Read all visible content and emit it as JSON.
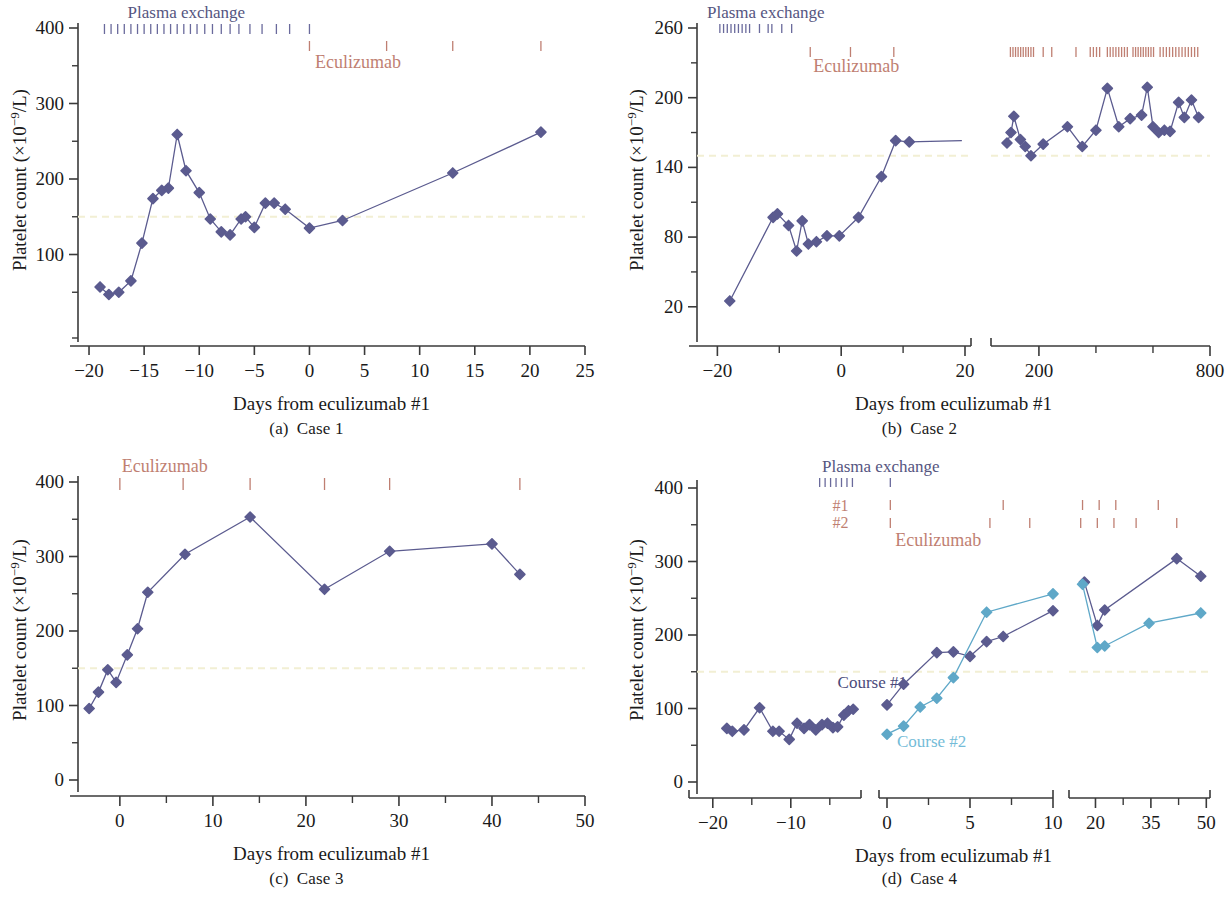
{
  "figure": {
    "axis_label_x": "Days from eculizumab #1",
    "axis_label_y": "Platelet count (×10−9/L)",
    "legend_plasma": "Plasma exchange",
    "legend_eculizumab": "Eculizumab",
    "colors": {
      "series_primary": "#5b5b8f",
      "series_secondary": "#5fa8c8",
      "plasma_tick": "#6a6a9c",
      "eculizumab_tick": "#bf7f72",
      "reference_line": "#f2efd4",
      "axis": "#3a3a3a",
      "text": "#1a1a1a"
    }
  },
  "panels": [
    {
      "id": "a",
      "caption_label": "(a)",
      "caption_title": "Case 1",
      "legend_plasma": "Plasma exchange",
      "legend_eculizumab": "Eculizumab",
      "reference_value": 150,
      "yticks": [
        100,
        200,
        300,
        400
      ],
      "ylim": [
        0,
        400
      ],
      "xticks": [
        -20,
        -15,
        -10,
        -5,
        0,
        5,
        10,
        15,
        20,
        25
      ],
      "xlim": [
        -21,
        25
      ],
      "plasma_ticks": [
        -18.6,
        -18.0,
        -17.4,
        -16.8,
        -16.2,
        -15.6,
        -15.0,
        -14.4,
        -13.8,
        -13.2,
        -12.6,
        -12.0,
        -11.4,
        -10.8,
        -10.2,
        -9.5,
        -8.8,
        -8.0,
        -7.2,
        -6.4,
        -5.4,
        -4.3,
        -3.0,
        -1.8,
        0.0
      ],
      "eculizumab_ticks": [
        0.0,
        7.0,
        13.0,
        21.0
      ]
    },
    {
      "id": "b",
      "caption_label": "(b)",
      "caption_title": "Case 2",
      "legend_plasma": "Plasma exchange",
      "legend_eculizumab": "Eculizumab",
      "reference_value": 150,
      "yticks": [
        20,
        80,
        140,
        200,
        260
      ],
      "ylim": [
        0,
        260
      ],
      "xticks_left": [
        -20,
        0,
        20
      ],
      "xlim_left": [
        -22,
        20
      ],
      "xticks_right": [
        200,
        800
      ],
      "xlim_right": [
        60,
        800
      ]
    },
    {
      "id": "c",
      "caption_label": "(c)",
      "caption_title": "Case 3",
      "legend_eculizumab": "Eculizumab",
      "reference_value": 150,
      "yticks": [
        0,
        100,
        200,
        300,
        400
      ],
      "ylim": [
        0,
        400
      ],
      "xticks": [
        0,
        10,
        20,
        30,
        40,
        50
      ],
      "xlim": [
        -4.5,
        50
      ],
      "eculizumab_ticks": [
        0.0,
        6.8,
        14.0,
        22.0,
        29.0,
        43.0
      ]
    },
    {
      "id": "d",
      "caption_label": "(d)",
      "caption_title": "Case 4",
      "legend_plasma": "Plasma exchange",
      "legend_eculizumab": "Eculizumab",
      "legend_course1": "Course #1",
      "legend_course2": "Course #2",
      "row_label_1": "#1",
      "row_label_2": "#2",
      "reference_value": 150,
      "yticks": [
        0,
        100,
        200,
        300,
        400
      ],
      "ylim": [
        0,
        400
      ],
      "xticks_left": [
        -20,
        -10
      ],
      "xticks_mid": [
        0,
        5,
        10
      ],
      "xticks_right": [
        20,
        35,
        50
      ]
    }
  ],
  "chart_data": [
    {
      "type": "line",
      "panel": "a",
      "title": "(a) Case 1",
      "xlabel": "Days from eculizumab #1",
      "ylabel": "Platelet count (×10−9/L)",
      "xlim": [
        -21,
        25
      ],
      "ylim": [
        0,
        400
      ],
      "xticks": [
        -20,
        -15,
        -10,
        -5,
        0,
        5,
        10,
        15,
        20,
        25
      ],
      "yticks": [
        100,
        200,
        300,
        400
      ],
      "grid": false,
      "reference_line": {
        "y": 150,
        "style": "dashed",
        "color": "#f2efd4"
      },
      "annotations": [
        {
          "text": "Plasma exchange",
          "role": "tick-row-label"
        },
        {
          "text": "Eculizumab",
          "role": "tick-row-label"
        }
      ],
      "series": [
        {
          "name": "Platelet count",
          "color": "#5b5b8f",
          "marker": "diamond",
          "x": [
            -19.0,
            -18.2,
            -17.3,
            -16.2,
            -15.2,
            -14.2,
            -13.4,
            -12.8,
            -12.0,
            -11.2,
            -10.0,
            -9.0,
            -8.0,
            -7.2,
            -6.2,
            -5.8,
            -5.0,
            -4.0,
            -3.2,
            -2.2,
            0.0,
            3.0,
            13.0,
            21.0
          ],
          "y": [
            57,
            47,
            50,
            65,
            115,
            174,
            185,
            188,
            259,
            211,
            182,
            147,
            130,
            126,
            147,
            150,
            136,
            168,
            168,
            160,
            135,
            145,
            208,
            262
          ]
        }
      ]
    },
    {
      "type": "line",
      "panel": "b",
      "title": "(b) Case 2",
      "xlabel": "Days from eculizumab #1",
      "ylabel": "Platelet count (×10−9/L)",
      "broken_axis": true,
      "xlim_left": [
        -22,
        20
      ],
      "xlim_right": [
        60,
        800
      ],
      "ylim": [
        0,
        260
      ],
      "xticks_left": [
        -20,
        0,
        20
      ],
      "xticks_right": [
        200,
        800
      ],
      "yticks": [
        20,
        80,
        140,
        200,
        260
      ],
      "grid": false,
      "reference_line": {
        "y": 150,
        "style": "dashed",
        "color": "#f2efd4"
      },
      "annotations": [
        {
          "text": "Plasma exchange",
          "role": "tick-row-label"
        },
        {
          "text": "Eculizumab",
          "role": "tick-row-label"
        }
      ],
      "series": [
        {
          "name": "Platelet count (left segment)",
          "color": "#5b5b8f",
          "marker": "diamond",
          "x": [
            -18.0,
            -11.0,
            -10.3,
            -8.5,
            -7.2,
            -6.3,
            -5.3,
            -4.0,
            -2.3,
            -0.3,
            2.8,
            6.5,
            8.8,
            11.0,
            19.5
          ],
          "y": [
            25,
            97,
            100,
            90,
            68,
            94,
            74,
            76,
            81,
            81,
            97,
            132,
            163,
            162,
            163
          ]
        },
        {
          "name": "Platelet count (right segment)",
          "color": "#5b5b8f",
          "marker": "diamond",
          "x": [
            88,
            102,
            112,
            135,
            152,
            172,
            215,
            300,
            352,
            400,
            440,
            480,
            520,
            560,
            580,
            600,
            620,
            640,
            660,
            690,
            710,
            735,
            760
          ],
          "y": [
            161,
            170,
            184,
            164,
            158,
            150,
            160,
            175,
            158,
            172,
            208,
            175,
            182,
            185,
            209,
            175,
            170,
            172,
            171,
            196,
            183,
            198,
            183
          ]
        }
      ]
    },
    {
      "type": "line",
      "panel": "c",
      "title": "(c) Case 3",
      "xlabel": "Days from eculizumab #1",
      "ylabel": "Platelet count (×10−9/L)",
      "xlim": [
        -4.5,
        50
      ],
      "ylim": [
        0,
        400
      ],
      "xticks": [
        0,
        10,
        20,
        30,
        40,
        50
      ],
      "yticks": [
        0,
        100,
        200,
        300,
        400
      ],
      "grid": false,
      "reference_line": {
        "y": 150,
        "style": "dashed",
        "color": "#f2efd4"
      },
      "annotations": [
        {
          "text": "Eculizumab",
          "role": "tick-row-label"
        }
      ],
      "series": [
        {
          "name": "Platelet count",
          "color": "#5b5b8f",
          "marker": "diamond",
          "x": [
            -3.3,
            -2.3,
            -1.3,
            -0.4,
            0.8,
            1.9,
            3.0,
            7.0,
            14.0,
            22.0,
            29.0,
            40.0,
            43.0
          ],
          "y": [
            96,
            118,
            148,
            131,
            168,
            203,
            252,
            303,
            353,
            256,
            307,
            317,
            276
          ]
        }
      ]
    },
    {
      "type": "line",
      "panel": "d",
      "title": "(d) Case 4",
      "xlabel": "Days from eculizumab #1",
      "ylabel": "Platelet count (×10−9/L)",
      "broken_axis": true,
      "segments": 3,
      "ylim": [
        0,
        400
      ],
      "xticks_left": [
        -20,
        -10
      ],
      "xticks_mid": [
        0,
        5,
        10
      ],
      "xticks_right": [
        20,
        35,
        50
      ],
      "grid": false,
      "reference_line": {
        "y": 150,
        "style": "dashed",
        "color": "#f2efd4"
      },
      "annotations": [
        {
          "text": "Plasma exchange",
          "role": "tick-row-label"
        },
        {
          "text": "#1",
          "role": "row-label"
        },
        {
          "text": "#2",
          "role": "row-label"
        },
        {
          "text": "Eculizumab",
          "role": "tick-row-label"
        },
        {
          "text": "Course #1",
          "role": "series-label",
          "color": "#5b5b8f"
        },
        {
          "text": "Course #2",
          "role": "series-label",
          "color": "#5fa8c8"
        }
      ],
      "series": [
        {
          "name": "Course #1 (baseline segment)",
          "color": "#5b5b8f",
          "marker": "diamond",
          "x": [
            -18.2,
            -17.5,
            -16.0,
            -14.0,
            -12.3,
            -11.5,
            -10.2,
            -9.2,
            -8.3,
            -7.6,
            -6.8,
            -6.0,
            -5.3,
            -4.6,
            -4.0,
            -3.2,
            -2.6,
            -2.0
          ],
          "y": [
            73,
            69,
            71,
            101,
            69,
            69,
            58,
            80,
            73,
            78,
            71,
            78,
            80,
            74,
            75,
            91,
            97,
            99
          ]
        },
        {
          "name": "Course #1 (treatment segment)",
          "color": "#5b5b8f",
          "marker": "diamond",
          "x": [
            0.0,
            1.0,
            3.0,
            4.0,
            5.0,
            6.0,
            7.0,
            10.0
          ],
          "y": [
            105,
            133,
            176,
            177,
            171,
            191,
            198,
            233
          ]
        },
        {
          "name": "Course #2 (treatment segment)",
          "color": "#5fa8c8",
          "marker": "diamond",
          "x": [
            0.0,
            1.0,
            2.0,
            3.0,
            4.0,
            6.0,
            10.0
          ],
          "y": [
            65,
            76,
            102,
            114,
            142,
            231,
            256
          ]
        },
        {
          "name": "Course #1 (late segment)",
          "color": "#5b5b8f",
          "marker": "diamond",
          "x": [
            17.0,
            20.5,
            22.5,
            42.0,
            48.5
          ],
          "y": [
            272,
            213,
            234,
            304,
            280
          ]
        },
        {
          "name": "Course #2 (late segment)",
          "color": "#5fa8c8",
          "marker": "diamond",
          "x": [
            16.5,
            20.5,
            22.5,
            34.5,
            48.5
          ],
          "y": [
            269,
            183,
            185,
            216,
            230
          ]
        }
      ]
    }
  ]
}
